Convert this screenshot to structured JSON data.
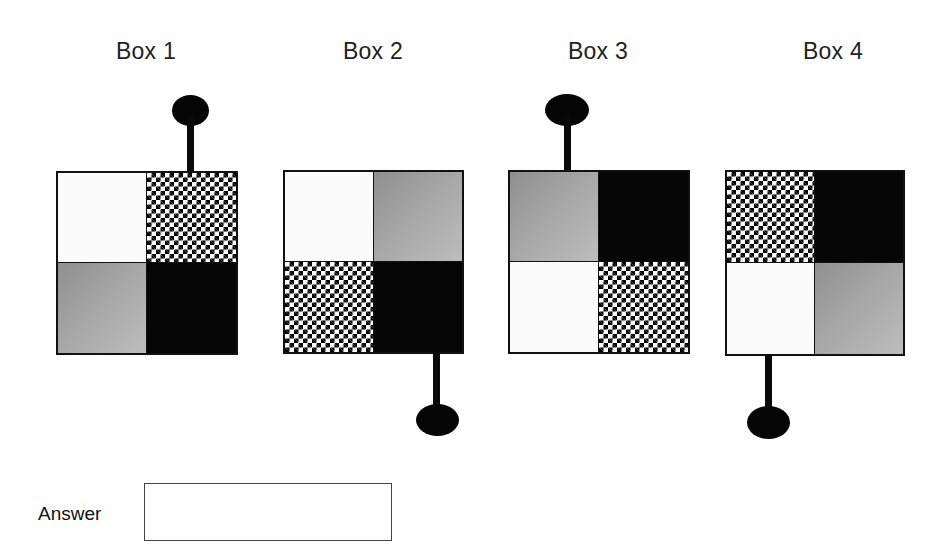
{
  "boxes": [
    {
      "label": "Box 1",
      "quadrants": {
        "top_left": "white",
        "top_right": "checker",
        "bottom_left": "gray",
        "bottom_right": "black"
      },
      "pin": {
        "side": "top",
        "position": "right"
      }
    },
    {
      "label": "Box 2",
      "quadrants": {
        "top_left": "white",
        "top_right": "gray",
        "bottom_left": "checker",
        "bottom_right": "black"
      },
      "pin": {
        "side": "bottom",
        "position": "right"
      }
    },
    {
      "label": "Box 3",
      "quadrants": {
        "top_left": "gray",
        "top_right": "black",
        "bottom_left": "white",
        "bottom_right": "checker"
      },
      "pin": {
        "side": "top",
        "position": "left"
      }
    },
    {
      "label": "Box 4",
      "quadrants": {
        "top_left": "checker",
        "top_right": "black",
        "bottom_left": "white",
        "bottom_right": "gray"
      },
      "pin": {
        "side": "bottom",
        "position": "left"
      }
    }
  ],
  "answer": {
    "label": "Answer",
    "value": "",
    "placeholder": ""
  },
  "colors": {
    "black": "#050505",
    "white": "#fbfbfb",
    "gray_start": "#8f8f8f",
    "gray_end": "#bdbdbd",
    "outline": "#111111"
  }
}
